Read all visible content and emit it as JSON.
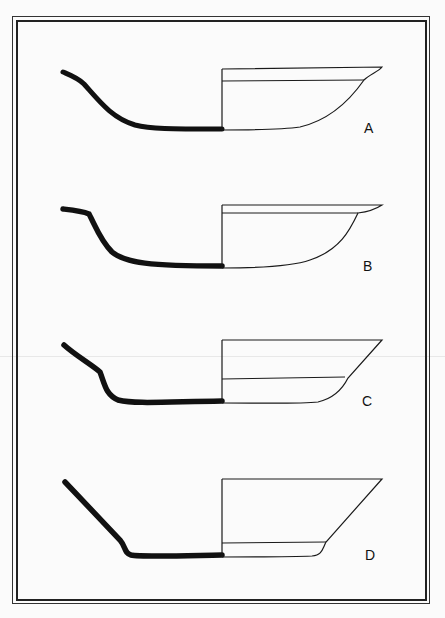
{
  "figure": {
    "type": "pottery-profile-drawings",
    "colors": {
      "section_fill": "#111111",
      "line": "#1a1a1a",
      "background": "#fbfbfb"
    },
    "profiles": [
      {
        "label": "A",
        "description": "shallow bowl, rounded base, everted thin rim"
      },
      {
        "label": "B",
        "description": "shallow bowl, rounded base, flattened projecting rim"
      },
      {
        "label": "C",
        "description": "carinated bowl, straight flaring walls"
      },
      {
        "label": "D",
        "description": "flat-based bowl with straight flaring walls and low foot angle"
      }
    ]
  }
}
